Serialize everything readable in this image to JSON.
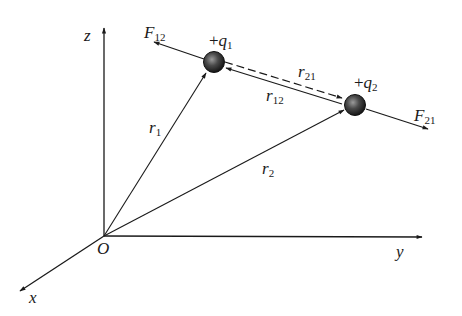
{
  "diagram": {
    "axes": {
      "origin_label": "O",
      "x_label": "x",
      "y_label": "y",
      "z_label": "z"
    },
    "charges": [
      {
        "sign": "+",
        "name": "q",
        "sub": "1"
      },
      {
        "sign": "+",
        "name": "q",
        "sub": "2"
      }
    ],
    "position_vectors": [
      {
        "name": "r",
        "sub": "1"
      },
      {
        "name": "r",
        "sub": "2"
      }
    ],
    "separation_vectors": [
      {
        "name": "r",
        "sub": "21",
        "style": "dashed"
      },
      {
        "name": "r",
        "sub": "12",
        "style": "solid"
      }
    ],
    "forces": [
      {
        "name": "F",
        "sub": "12"
      },
      {
        "name": "F",
        "sub": "21"
      }
    ],
    "colors": {
      "line": "#1a1a1a",
      "charge_fill": "#2a2a2a",
      "background": "#ffffff"
    }
  }
}
